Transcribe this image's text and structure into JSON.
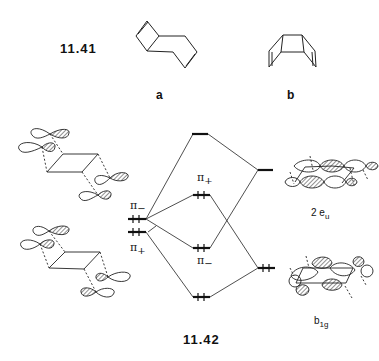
{
  "figure": {
    "structures": {
      "equation_number": "11.41",
      "label_a": "a",
      "label_b": "b"
    },
    "diagram": {
      "equation_number": "11.42",
      "left_levels": [
        {
          "label_symbol": "π",
          "label_sub": "−",
          "occupancy": "filled"
        },
        {
          "label_symbol": "π",
          "label_sub": "+",
          "occupancy": "filled"
        }
      ],
      "middle_levels": [
        {
          "label_symbol": "",
          "label_sub": "",
          "occupancy": "empty"
        },
        {
          "label_symbol": "π",
          "label_sub": "+",
          "occupancy": "filled"
        },
        {
          "label_symbol": "π",
          "label_sub": "−",
          "occupancy": "filled"
        },
        {
          "label_symbol": "",
          "label_sub": "",
          "occupancy": "filled"
        }
      ],
      "right_levels": [
        {
          "label_main": "2 e",
          "label_sub": "u",
          "occupancy": "empty"
        },
        {
          "label_main": "b",
          "label_sub": "1g",
          "occupancy": "filled"
        }
      ]
    }
  }
}
